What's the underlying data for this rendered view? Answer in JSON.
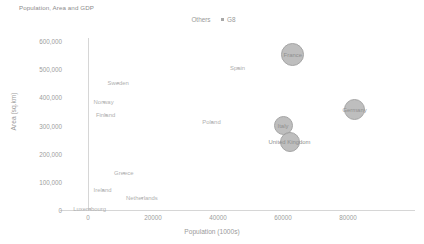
{
  "chart_data": {
    "type": "scatter",
    "title": "Population, Area and GDP",
    "xlabel": "Population (1000s)",
    "ylabel": "Area (sq.km)",
    "xlim": [
      0,
      88000
    ],
    "ylim": [
      0,
      600000
    ],
    "xticks": [
      "0",
      "20000",
      "40000",
      "60000",
      "80000"
    ],
    "xtick_values": [
      0,
      20000,
      40000,
      60000,
      80000
    ],
    "yticks": [
      "0",
      "100,000",
      "200,000",
      "300,000",
      "400,000",
      "500,000",
      "600,000"
    ],
    "ytick_values": [
      0,
      100000,
      200000,
      300000,
      400000,
      500000,
      600000
    ],
    "grid": false,
    "legend_position": "top-center",
    "legend": [
      {
        "name": "Others",
        "marker": "none",
        "color": "#c9c9c9"
      },
      {
        "name": "G8",
        "marker": "square",
        "color": "#a8a8a8"
      }
    ],
    "series": [
      {
        "name": "Others",
        "points": [
          {
            "label": "Sweden",
            "x": 9300,
            "y": 450000,
            "size": 2
          },
          {
            "label": "Norway",
            "x": 4800,
            "y": 385000,
            "size": 2
          },
          {
            "label": "Finland",
            "x": 5400,
            "y": 338000,
            "size": 2
          },
          {
            "label": "Spain",
            "x": 46000,
            "y": 505000,
            "size": 2
          },
          {
            "label": "Poland",
            "x": 38000,
            "y": 312000,
            "size": 2
          },
          {
            "label": "Greece",
            "x": 11000,
            "y": 132000,
            "size": 2
          },
          {
            "label": "Ireland",
            "x": 4500,
            "y": 70000,
            "size": 2
          },
          {
            "label": "Netherlands",
            "x": 16600,
            "y": 41500,
            "size": 2
          },
          {
            "label": "Luxembourg",
            "x": 500,
            "y": 2600,
            "size": 2
          }
        ]
      },
      {
        "name": "G8",
        "points": [
          {
            "label": "France",
            "x": 63000,
            "y": 551500,
            "size": 21
          },
          {
            "label": "Germany",
            "x": 82000,
            "y": 357000,
            "size": 19
          },
          {
            "label": "Italy",
            "x": 60000,
            "y": 301000,
            "size": 17
          },
          {
            "label": "United Kingdom",
            "x": 62000,
            "y": 243000,
            "size": 18
          }
        ]
      }
    ]
  }
}
